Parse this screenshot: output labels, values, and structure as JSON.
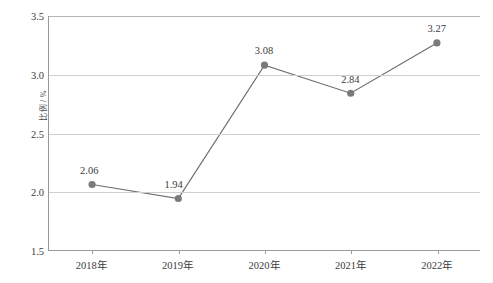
{
  "chart_data": {
    "type": "line",
    "title": "",
    "subtitle": "",
    "xlabel": "",
    "ylabel": "比例 / %",
    "categories": [
      "2018年",
      "2019年",
      "2020年",
      "2021年",
      "2022年"
    ],
    "values": [
      2.06,
      1.94,
      3.08,
      2.84,
      3.27
    ],
    "point_labels": [
      "2.06",
      "1.94",
      "3.08",
      "2.84",
      "3.27"
    ],
    "ylim": [
      1.5,
      3.5
    ],
    "y_ticks": [
      1.5,
      2.0,
      2.5,
      3.0,
      3.5
    ],
    "y_tick_labels": [
      "1.5",
      "2.0",
      "2.5",
      "3.0",
      "3.5"
    ],
    "grid": true,
    "grid_axis": "y",
    "legend": false,
    "legend_position": "none",
    "series": [
      {
        "name": "比例",
        "values": [
          2.06,
          1.94,
          3.08,
          2.84,
          3.27
        ]
      }
    ],
    "colors": {
      "line": "#6e6e6e",
      "marker": "#7a7a7a",
      "grid": "#cfcfcf",
      "axis": "#9a9a9a",
      "text": "#3c3c3c",
      "background": "#ffffff"
    },
    "marker_style": "circle",
    "marker_size": 6,
    "line_width": 1.2
  }
}
